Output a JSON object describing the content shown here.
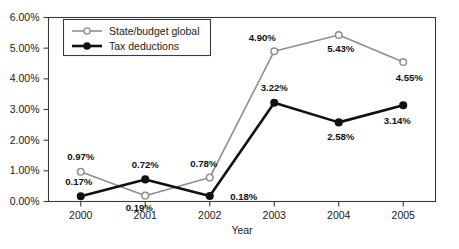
{
  "chart_data": {
    "type": "line",
    "title": "",
    "xlabel": "Year",
    "ylabel": "",
    "categories": [
      "2000",
      "2001",
      "2002",
      "2003",
      "2004",
      "2005"
    ],
    "ylim": [
      0,
      6
    ],
    "ytick_labels": [
      "0.00%",
      "1.00%",
      "2.00%",
      "3.00%",
      "4.00%",
      "5.00%",
      "6.00%"
    ],
    "ytick_values": [
      0,
      1,
      2,
      3,
      4,
      5,
      6
    ],
    "grid": false,
    "legend_position": "upper-left-inside",
    "series": [
      {
        "name": "State/budget global",
        "color": "#8f8f8f",
        "marker": "open-circle",
        "values": [
          0.97,
          0.19,
          0.78,
          4.9,
          5.43,
          4.55
        ],
        "labels": [
          "0.97%",
          "0.19%",
          "0.78%",
          "4.90%",
          "5.43%",
          "4.55%"
        ]
      },
      {
        "name": "Tax deductions",
        "color": "#111111",
        "marker": "filled-circle",
        "values": [
          0.17,
          0.72,
          0.18,
          3.22,
          2.58,
          3.14
        ],
        "labels": [
          "0.17%",
          "0.72%",
          "0.18%",
          "3.22%",
          "2.58%",
          "3.14%"
        ]
      }
    ]
  },
  "colors": {
    "series_gray": "#8f8f8f",
    "series_black": "#111111",
    "frame": "#3b3b3b",
    "background": "#ffffff"
  }
}
